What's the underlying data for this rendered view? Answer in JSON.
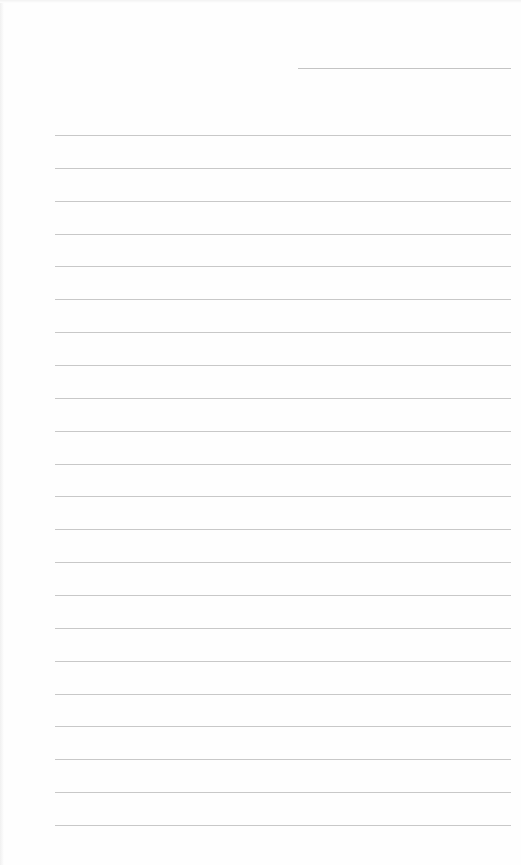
{
  "page": {
    "type": "lined-paper",
    "header_line": {
      "present": true
    },
    "ruled_line_count": 22,
    "line_color": "#c8c8c8",
    "background_color": "#fefefe"
  }
}
